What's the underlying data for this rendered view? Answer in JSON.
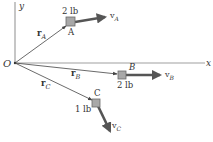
{
  "axes": {
    "x_label": "x",
    "y_label": "y",
    "origin_label": "O"
  },
  "particles": [
    {
      "id": "A",
      "label": "A",
      "weight": "2 lb",
      "position_vector": "r",
      "position_sub": "A",
      "velocity": "v",
      "velocity_sub": "A"
    },
    {
      "id": "B",
      "label": "B",
      "weight": "2 lb",
      "position_vector": "r",
      "position_sub": "B",
      "velocity": "v",
      "velocity_sub": "B"
    },
    {
      "id": "C",
      "label": "C",
      "weight": "1 lb",
      "position_vector": "r",
      "position_sub": "C",
      "velocity": "v",
      "velocity_sub": "C"
    }
  ],
  "colors": {
    "axis": "#9a9a9a",
    "vector": "#444444",
    "block_fill": "#a8a8a8",
    "block_stroke": "#6a6a6a",
    "velocity_arrow": "#555555",
    "text": "#333333"
  }
}
